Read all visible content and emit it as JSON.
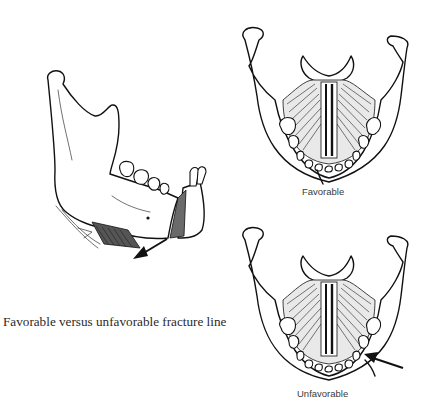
{
  "figure": {
    "caption": "Favorable versus unfavorable fracture line",
    "panels": [
      {
        "id": "lateral",
        "view": "lateral mandible with fracture",
        "arrow": "displacement-arrow"
      },
      {
        "id": "favorable",
        "label": "Favorable",
        "view": "inferior view of mandible"
      },
      {
        "id": "unfavorable",
        "label": "Unfavorable",
        "view": "inferior view of mandible",
        "arrow": "displacement-arrow"
      }
    ]
  },
  "colors": {
    "ink": "#111111",
    "background": "#ffffff",
    "label_text": "#3a3a3a"
  }
}
